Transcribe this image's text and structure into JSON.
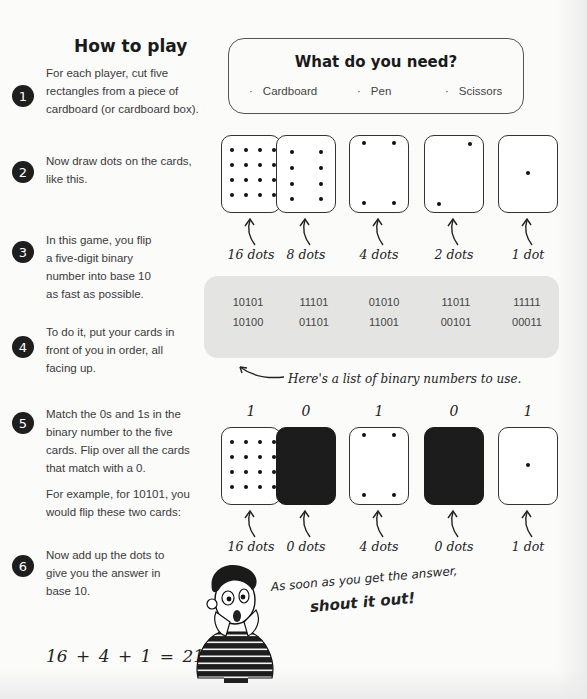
{
  "title": "How to play",
  "steps": [
    {
      "number": "1",
      "paragraphs": [
        "For each player, cut five rectangles from a piece of cardboard (or cardboard box)."
      ]
    },
    {
      "number": "2",
      "paragraphs": [
        "Now draw dots on the cards, like this."
      ]
    },
    {
      "number": "3",
      "paragraphs": [
        "In this game, you flip a five-digit binary number into base 10 as fast as possible."
      ]
    },
    {
      "number": "4",
      "paragraphs": [
        "To do it, put your cards in front of you in order, all facing up."
      ]
    },
    {
      "number": "5",
      "paragraphs": [
        "Match the 0s and 1s in the binary number to the five cards. Flip over all the cards that match with a 0.",
        "For example, for 10101, you would flip these two cards:"
      ]
    },
    {
      "number": "6",
      "paragraphs": [
        "Now add up the dots to give you the answer in base 10."
      ]
    }
  ],
  "needs": {
    "title": "What do you need?",
    "bullet": "·",
    "items": [
      "Cardboard",
      "Pen",
      "Scissors"
    ]
  },
  "cards_row": {
    "cards": [
      {
        "dots": 16,
        "label": "16 dots"
      },
      {
        "dots": 8,
        "label": "8 dots"
      },
      {
        "dots": 4,
        "label": "4 dots"
      },
      {
        "dots": 2,
        "label": "2 dots"
      },
      {
        "dots": 1,
        "label": "1 dot"
      }
    ]
  },
  "binary_list": {
    "rows": [
      [
        "10101",
        "11101",
        "01010",
        "11011",
        "11111"
      ],
      [
        "10100",
        "01101",
        "11001",
        "00101",
        "00011"
      ]
    ],
    "note": "Here's a list of binary numbers to use."
  },
  "example": {
    "binary": "10101",
    "cards": [
      {
        "digit": "1",
        "dots": 16,
        "flipped": false,
        "label": "16 dots"
      },
      {
        "digit": "0",
        "dots": 8,
        "flipped": true,
        "label": "0 dots"
      },
      {
        "digit": "1",
        "dots": 4,
        "flipped": false,
        "label": "4 dots"
      },
      {
        "digit": "0",
        "dots": 2,
        "flipped": true,
        "label": "0 dots"
      },
      {
        "digit": "1",
        "dots": 1,
        "flipped": false,
        "label": "1 dot"
      }
    ]
  },
  "equation": "16 + 4 + 1 = 21",
  "shout": {
    "line1": "As soon as you get the answer,",
    "line2": "shout it out!"
  },
  "icons": {
    "arrow": "curved-up-arrow-icon",
    "note_arrow": "curved-left-arrow-icon",
    "illustration": "surprised-boy-illustration"
  }
}
